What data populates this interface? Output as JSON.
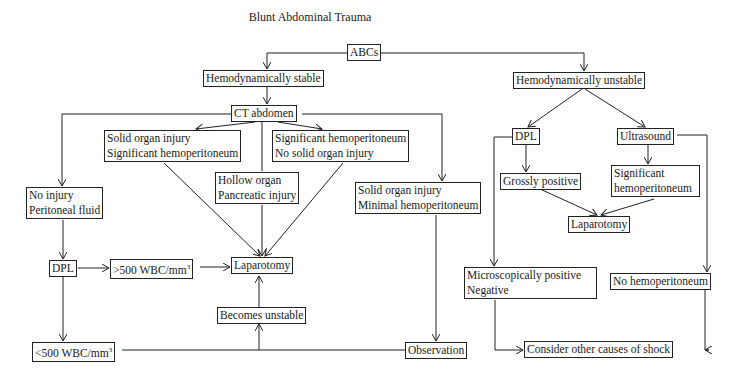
{
  "title": "Blunt Abdominal Trauma",
  "nodes": {
    "abcs": {
      "label": "ABCs"
    },
    "hemo_stable": {
      "label": "Hemodynamically stable"
    },
    "ct_abdomen": {
      "label": "CT abdomen"
    },
    "hemo_unstable": {
      "label": "Hemodynamically unstable"
    },
    "solid_sig": {
      "lines": [
        "Solid organ injury",
        "Significant hemoperitoneum"
      ]
    },
    "sig_nosolid": {
      "lines": [
        "Significant hemoperitoneum",
        "No solid organ injury"
      ]
    },
    "hollow": {
      "lines": [
        "Hollow organ",
        "Pancreatic injury"
      ]
    },
    "no_injury": {
      "lines": [
        "No injury",
        "Peritoneal fluid"
      ]
    },
    "solid_min": {
      "lines": [
        "Solid organ injury",
        "Minimal hemoperitoneum"
      ]
    },
    "dpl_left": {
      "label": "DPL"
    },
    "gt500": {
      "label": ">500 WBC/mm",
      "sup": "3"
    },
    "laparotomy_center": {
      "label": "Laparotomy"
    },
    "becomes_unstable": {
      "label": "Becomes unstable"
    },
    "lt500": {
      "label": "<500 WBC/mm",
      "sup": "3"
    },
    "observation": {
      "label": "Observation"
    },
    "dpl_right": {
      "label": "DPL"
    },
    "ultrasound": {
      "label": "Ultrasound"
    },
    "grossly_positive": {
      "label": "Grossly positive"
    },
    "sig_hemo_us": {
      "lines": [
        "Significant",
        "hemoperitoneum"
      ]
    },
    "laparotomy_right": {
      "label": "Laparotomy"
    },
    "micro_neg": {
      "lines": [
        "Microscopically positive",
        "Negative"
      ]
    },
    "no_hemo": {
      "label": "No hemoperitoneum"
    },
    "other_causes": {
      "label": "Consider other causes of shock"
    }
  }
}
